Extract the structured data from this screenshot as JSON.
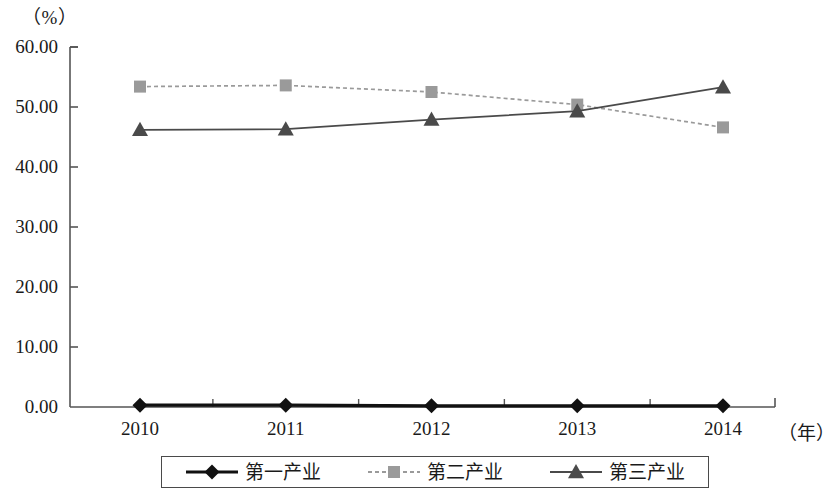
{
  "chart_data": {
    "type": "line",
    "title": "",
    "subtitle": "",
    "xlabel": "（年）",
    "ylabel": "（%）",
    "categories": [
      "2010",
      "2011",
      "2012",
      "2013",
      "2014"
    ],
    "x": [
      2010,
      2011,
      2012,
      2013,
      2014
    ],
    "ylim": [
      0.0,
      60.0
    ],
    "yticks": [
      "0.00",
      "10.00",
      "20.00",
      "30.00",
      "40.00",
      "50.00",
      "60.00"
    ],
    "ytick_values": [
      0,
      10,
      20,
      30,
      40,
      50,
      60
    ],
    "grid": false,
    "legend_position": "bottom",
    "series": [
      {
        "name": "第一产业",
        "values": [
          0.3,
          0.3,
          0.2,
          0.2,
          0.2
        ],
        "marker": "diamond",
        "color": "#111111",
        "line_style": "solid"
      },
      {
        "name": "第二产业",
        "values": [
          53.4,
          53.6,
          52.5,
          50.4,
          46.6
        ],
        "marker": "square",
        "color": "#9a9a9a",
        "line_style": "dashed"
      },
      {
        "name": "第三产业",
        "values": [
          46.2,
          46.3,
          47.9,
          49.3,
          53.3
        ],
        "marker": "triangle",
        "color": "#4a4a4a",
        "line_style": "solid"
      }
    ]
  },
  "axis": {
    "unit_y": "（%）",
    "unit_x": "（年）"
  },
  "colors": {
    "axis": "#555555",
    "series1": "#111111",
    "series2": "#9a9a9a",
    "series3": "#4a4a4a",
    "legend_border": "#4a4a4a",
    "background": "#ffffff"
  }
}
